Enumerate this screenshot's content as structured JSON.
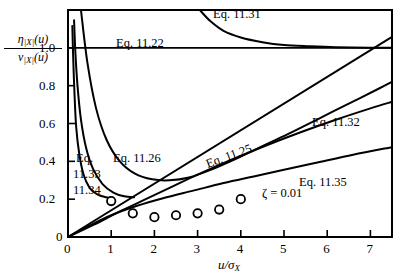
{
  "chart_data": {
    "type": "line",
    "title": "",
    "xlabel": "u/σX",
    "ylabel": "η|X|(u) / ν|X|(u)",
    "xlim": [
      0,
      7.5
    ],
    "ylim": [
      0,
      1.2
    ],
    "xticks": [
      "0",
      "1",
      "2",
      "3",
      "4",
      "5",
      "6",
      "7"
    ],
    "xtick_values": [
      0,
      1,
      2,
      3,
      4,
      5,
      6,
      7
    ],
    "yticks": [
      "0",
      "0.2",
      "0.4",
      "0.6",
      "0.8",
      "1.0"
    ],
    "ytick_values": [
      0,
      0.2,
      0.4,
      0.6,
      0.8,
      1.0
    ],
    "grid": false,
    "legend_position": "inline-annotations",
    "annotations": [
      {
        "text": "ζ = 0.01",
        "x": 5.0,
        "y": 0.22
      }
    ],
    "series": [
      {
        "name": "Eq. 11.22",
        "label": "Eq. 11.22",
        "type": "horizontal-line",
        "x": [
          0.0,
          7.5
        ],
        "values": [
          1.0,
          1.0
        ]
      },
      {
        "name": "Eq. 11.31",
        "label": "Eq. 11.31",
        "type": "curve",
        "x": [
          3.05,
          3.3,
          3.6,
          4.0,
          4.5,
          5.0,
          5.6,
          6.2,
          7.0,
          7.5
        ],
        "values": [
          1.2,
          1.14,
          1.09,
          1.055,
          1.03,
          1.015,
          1.008,
          1.003,
          1.0,
          1.0
        ]
      },
      {
        "name": "Eq. 11.25",
        "label": "Eq. 11.25",
        "type": "straight-line",
        "x": [
          0.0,
          7.5
        ],
        "values": [
          0.0,
          1.058
        ]
      },
      {
        "name": "Eq. 11.32",
        "label": "Eq. 11.32",
        "type": "curve",
        "x": [
          0.0,
          0.6,
          1.2,
          1.8,
          2.4,
          3.0,
          3.8,
          4.6,
          5.4,
          6.2,
          7.0,
          7.5
        ],
        "values": [
          0.0,
          0.065,
          0.135,
          0.2,
          0.265,
          0.33,
          0.41,
          0.485,
          0.555,
          0.62,
          0.68,
          0.715
        ]
      },
      {
        "name": "Eq. 11.35",
        "label": "Eq. 11.35",
        "type": "curve",
        "x": [
          0.0,
          0.5,
          1.0,
          1.6,
          2.2,
          2.9,
          3.6,
          4.3,
          5.0,
          5.8,
          6.6,
          7.5
        ],
        "values": [
          0.0,
          0.06,
          0.115,
          0.165,
          0.205,
          0.245,
          0.285,
          0.32,
          0.355,
          0.395,
          0.435,
          0.475
        ]
      },
      {
        "name": "Eq. 11.33",
        "label": "Eq. 11.33",
        "type": "decaying-curve",
        "x": [
          0.14,
          0.17,
          0.22,
          0.3,
          0.42,
          0.58,
          0.8,
          1.05,
          1.3,
          1.55
        ],
        "values": [
          1.15,
          0.98,
          0.8,
          0.62,
          0.47,
          0.36,
          0.28,
          0.235,
          0.215,
          0.21
        ]
      },
      {
        "name": "Eq. 11.34",
        "label": "Eq. 11.34",
        "type": "decaying-curve",
        "x": [
          0.1,
          0.12,
          0.15,
          0.19,
          0.26,
          0.36,
          0.5,
          0.68,
          0.88,
          1.05
        ],
        "values": [
          1.12,
          0.95,
          0.76,
          0.58,
          0.44,
          0.33,
          0.26,
          0.225,
          0.21,
          0.205
        ]
      },
      {
        "name": "Eq. 11.26",
        "label": "Eq. 11.26",
        "type": "u-curve",
        "x": [
          0.3,
          0.45,
          0.65,
          0.9,
          1.2,
          1.55,
          1.95,
          2.35,
          2.8,
          3.3,
          3.9,
          4.5,
          5.1,
          5.8,
          6.5,
          7.2,
          7.5
        ],
        "values": [
          1.2,
          0.92,
          0.68,
          0.51,
          0.4,
          0.335,
          0.305,
          0.3,
          0.315,
          0.355,
          0.415,
          0.48,
          0.545,
          0.625,
          0.705,
          0.785,
          0.82
        ]
      },
      {
        "name": "data points",
        "label": "simulation data",
        "type": "scatter",
        "marker": "open-circle",
        "x": [
          1.0,
          1.5,
          2.0,
          2.5,
          3.0,
          3.5,
          4.0
        ],
        "values": [
          0.19,
          0.125,
          0.105,
          0.115,
          0.125,
          0.145,
          0.2
        ]
      }
    ],
    "curve_labels": [
      {
        "id": "eq1131",
        "text": "Eq. 11.31",
        "x_px": 213,
        "y_px": 8,
        "rotate": 0
      },
      {
        "id": "eq1122",
        "text": "Eq. 11.22",
        "x_px": 116,
        "y_px": 37,
        "rotate": 0
      },
      {
        "id": "eq1126",
        "text": "Eq. 11.26",
        "x_px": 113,
        "y_px": 152,
        "rotate": 0
      },
      {
        "id": "eq1125",
        "text": "Eq. 11.25",
        "x_px": 205,
        "y_px": 150,
        "rotate": -20
      },
      {
        "id": "eq1132",
        "text": "Eq. 11.32",
        "x_px": 312,
        "y_px": 116,
        "rotate": 0
      },
      {
        "id": "eq1135",
        "text": "Eq. 11.35",
        "x_px": 299,
        "y_px": 176,
        "rotate": 0
      },
      {
        "id": "eq1133a",
        "text": "Eq.",
        "x_px": 76,
        "y_px": 152,
        "rotate": 0
      },
      {
        "id": "eq1133b",
        "text": "11.33",
        "x_px": 73,
        "y_px": 168,
        "rotate": 0
      },
      {
        "id": "eq1134",
        "text": "11.34",
        "x_px": 73,
        "y_px": 184,
        "rotate": 0
      }
    ]
  },
  "axes": {
    "y_label_numerator": "η",
    "y_label_num_sub": "|X|",
    "y_label_num_arg": "(u)",
    "y_label_denominator": "ν",
    "y_label_den_sub": "|X|",
    "y_label_den_arg": "(u)",
    "x_label_main": "u/σ",
    "x_label_sub": "X"
  },
  "colors": {
    "line": "#000000",
    "background": "#ffffff",
    "marker_stroke": "#000000"
  }
}
